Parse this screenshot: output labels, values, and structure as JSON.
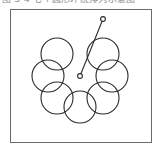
{
  "caption": {
    "text": "图 3-4  七个圆形环绕排列示意图"
  },
  "figure": {
    "frame": {
      "x": 10,
      "y": 9,
      "width": 142,
      "height": 134,
      "stroke": "#6a6a6a",
      "stroke_width": 1,
      "fill": "#ffffff"
    },
    "stroke_color": "#2b2b2b",
    "stroke_width": 1.1,
    "ring": {
      "description": "Seven equal circles arranged in an open C-shaped ring, gap at the top",
      "count": 7,
      "center_x": 80,
      "center_y": 76,
      "ring_radius": 32,
      "circle_radius": 16,
      "circles": [
        {
          "id": "circle-1",
          "label": "top-left",
          "cx": 57,
          "cy": 54,
          "r": 16
        },
        {
          "id": "circle-2",
          "label": "left",
          "cx": 48,
          "cy": 76,
          "r": 16
        },
        {
          "id": "circle-3",
          "label": "bottom-left",
          "cx": 57,
          "cy": 98,
          "r": 16
        },
        {
          "id": "circle-4",
          "label": "bottom",
          "cx": 80,
          "cy": 107,
          "r": 16
        },
        {
          "id": "circle-5",
          "label": "bottom-right",
          "cx": 103,
          "cy": 98,
          "r": 16
        },
        {
          "id": "circle-6",
          "label": "right",
          "cx": 112,
          "cy": 76,
          "r": 16
        },
        {
          "id": "circle-7",
          "label": "top-right",
          "cx": 103,
          "cy": 54,
          "r": 16
        }
      ]
    },
    "pointer": {
      "description": "Straight line segment with small open circle markers at both ends",
      "start": {
        "x": 80,
        "y": 76,
        "marker_r": 2.4
      },
      "end": {
        "x": 103,
        "y": 19,
        "marker_r": 2.4
      },
      "line_width": 1.1
    }
  }
}
